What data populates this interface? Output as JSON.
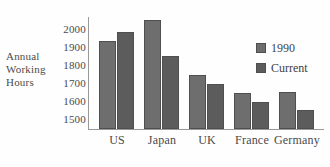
{
  "chart_data": {
    "type": "bar",
    "title": "",
    "xlabel": "",
    "ylabel": "Annual Working Hours",
    "ylabel_lines": [
      "Annual",
      "Working",
      "Hours"
    ],
    "categories": [
      "US",
      "Japan",
      "UK",
      "France",
      "Germany"
    ],
    "series": [
      {
        "name": "1990",
        "color": "#6e6e6e",
        "values": [
          1940,
          2060,
          1750,
          1650,
          1655
        ]
      },
      {
        "name": "Current",
        "color": "#5c5c5c",
        "values": [
          1990,
          1855,
          1700,
          1600,
          1555
        ]
      }
    ],
    "ylim": [
      1450,
      2075
    ],
    "yticks": [
      1500,
      1600,
      1700,
      1800,
      1900,
      2000
    ],
    "ytick_labels": [
      "1500",
      "1600",
      "1700",
      "1800",
      "1900",
      "2000"
    ],
    "grid": false,
    "legend_position": "right"
  },
  "legend": {
    "entries": [
      {
        "label": "1990"
      },
      {
        "label": "Current"
      }
    ]
  },
  "colors": {
    "series_1990": "#6e6e6e",
    "series_current": "#5c5c5c",
    "axis": "#9a9a9a",
    "text": "#4a4a4a",
    "background": "#fefefe"
  }
}
